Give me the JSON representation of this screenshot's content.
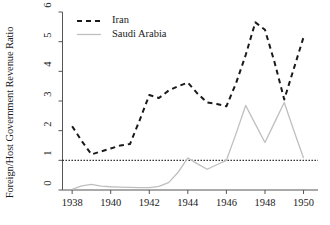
{
  "chart_data": {
    "type": "line",
    "title": "",
    "xlabel": "",
    "ylabel": "Foreign/Host Government Revenue Ratio",
    "xlim": [
      1937.5,
      1950.75
    ],
    "ylim": [
      0,
      6
    ],
    "yticks": [
      0,
      1,
      2,
      3,
      4,
      5,
      6
    ],
    "ytick_labels": [
      "0",
      "1",
      "2",
      "3",
      "4",
      "5",
      "6"
    ],
    "xticks": [
      1938,
      1940,
      1942,
      1944,
      1946,
      1948,
      1950
    ],
    "xtick_labels": [
      "1938",
      "1940",
      "1942",
      "1944",
      "1946",
      "1948",
      "1950"
    ],
    "grid": false,
    "legend_position": "top-left",
    "reference_line": {
      "y": 1,
      "style": "dotted",
      "color": "#222222"
    },
    "series": [
      {
        "name": "Iran",
        "style": "dashed",
        "color": "#1a1a1a",
        "x": [
          1938,
          1938.5,
          1939,
          1939.5,
          1940,
          1940.5,
          1941,
          1941.5,
          1942,
          1942.5,
          1943,
          1943.5,
          1944,
          1944.5,
          1945,
          1945.5,
          1946,
          1946.5,
          1947,
          1947.5,
          1948,
          1948.5,
          1949,
          1949.5,
          1950
        ],
        "values": [
          2.15,
          1.65,
          1.2,
          1.3,
          1.4,
          1.5,
          1.55,
          2.35,
          3.2,
          3.1,
          3.35,
          3.5,
          3.62,
          3.25,
          2.95,
          2.9,
          2.82,
          3.6,
          4.55,
          5.65,
          5.4,
          4.3,
          3.05,
          4.1,
          5.15
        ]
      },
      {
        "name": "Saudi Arabia",
        "style": "solid",
        "color": "#bfbfbf",
        "x": [
          1938,
          1938.5,
          1939,
          1939.5,
          1940,
          1940.5,
          1941,
          1941.5,
          1942,
          1942.5,
          1943,
          1943.5,
          1944,
          1944.5,
          1945,
          1945.5,
          1946,
          1946.5,
          1947,
          1947.5,
          1948,
          1948.5,
          1949,
          1949.5,
          1950
        ],
        "values": [
          0.02,
          0.14,
          0.19,
          0.13,
          0.11,
          0.1,
          0.09,
          0.08,
          0.08,
          0.12,
          0.25,
          0.6,
          1.08,
          0.88,
          0.7,
          0.85,
          1.0,
          1.9,
          2.85,
          2.22,
          1.6,
          2.28,
          2.95,
          2.0,
          1.08
        ]
      }
    ]
  },
  "legend": {
    "items": [
      {
        "label": "Iran",
        "style": "dashed",
        "color": "#1a1a1a"
      },
      {
        "label": "Saudi Arabia",
        "style": "solid",
        "color": "#bfbfbf"
      }
    ]
  }
}
